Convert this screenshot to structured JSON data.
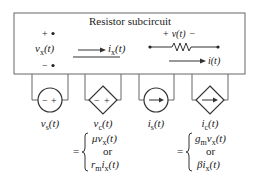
{
  "subcircuit": {
    "title": "Resistor subcircuit",
    "port": {
      "plus": "+",
      "minus": "−",
      "label_var": "v",
      "label_sub": "x",
      "label_arg": "(t)"
    },
    "current_arrow": {
      "var": "i",
      "sub": "x",
      "arg": "(t)"
    },
    "resistor": {
      "v_plus": "+",
      "v_var": "v",
      "v_arg": "(t)",
      "v_minus": "−",
      "i_var": "i",
      "i_arg": "(t)"
    }
  },
  "sources": [
    {
      "type": "independent-voltage",
      "var": "v",
      "sub": "s",
      "arg": "(t)",
      "minus": "−",
      "plus": "+"
    },
    {
      "type": "dependent-voltage",
      "var": "v",
      "sub": "c",
      "arg": "(t)",
      "minus": "−",
      "plus": "+"
    },
    {
      "type": "independent-current",
      "var": "i",
      "sub": "s",
      "arg": "(t)"
    },
    {
      "type": "dependent-current",
      "var": "i",
      "sub": "c",
      "arg": "(t)"
    }
  ],
  "equations": {
    "voltage": {
      "eq": "=",
      "line1": {
        "coef": "μv",
        "sub": "x",
        "arg": "(t)"
      },
      "or": "or",
      "line2": {
        "coef": "r",
        "coef_sub": "m",
        "var": "i",
        "sub": "x",
        "arg": "(t)"
      }
    },
    "current": {
      "eq": "=",
      "line1": {
        "coef": "g",
        "coef_sub": "m",
        "var": "v",
        "sub": "x",
        "arg": "(t)"
      },
      "or": "or",
      "line2": {
        "coef": "βi",
        "sub": "x",
        "arg": "(t)"
      }
    }
  },
  "colors": {
    "stroke": "#555555",
    "text": "#222222"
  }
}
